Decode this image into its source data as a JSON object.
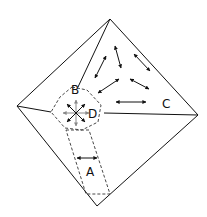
{
  "diagram": {
    "labels": {
      "A": "A",
      "B": "B",
      "C": "C",
      "D": "D"
    },
    "colors": {
      "line": "#111111",
      "dashed": "#333333",
      "gray_arrow": "#888888",
      "background": "#ffffff"
    },
    "regions": [
      {
        "id": "A",
        "description": "dashed strip region with horizontal double arrow"
      },
      {
        "id": "B",
        "description": "label at top of dashed hexagon"
      },
      {
        "id": "C",
        "description": "upper-right triangular region with randomly oriented double arrows"
      },
      {
        "id": "D",
        "description": "dashed hexagon junction with radial arrows"
      }
    ]
  }
}
